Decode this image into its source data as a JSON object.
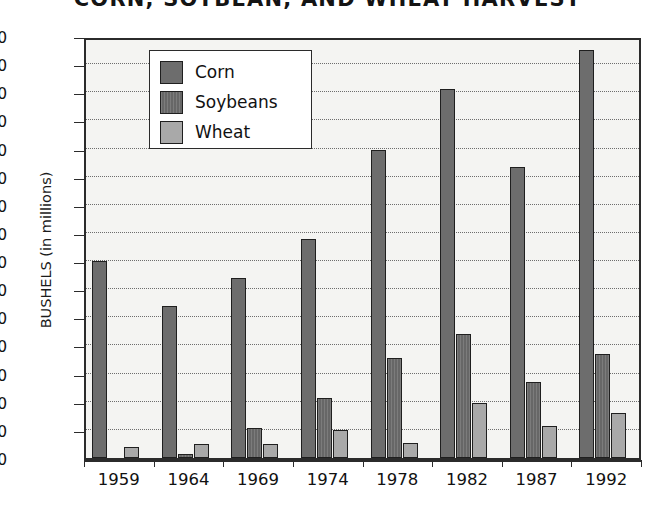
{
  "chart_data": {
    "type": "bar",
    "title": "CORN, SOYBEAN, AND WHEAT HARVEST",
    "xlabel": "",
    "ylabel": "BUSHELS (in millions)",
    "ylim": [
      0,
      150
    ],
    "ytick_step": 10,
    "yticks": [
      0,
      10,
      20,
      30,
      40,
      50,
      60,
      70,
      80,
      90,
      100,
      110,
      120,
      130,
      140,
      150
    ],
    "grid": "horizontal-dotted",
    "legend_position": "top-left-inside",
    "categories": [
      "1959",
      "1964",
      "1969",
      "1974",
      "1978",
      "1982",
      "1987",
      "1992"
    ],
    "series": [
      {
        "name": "Corn",
        "color": "#6d6d6d",
        "values": [
          70,
          54,
          64,
          78,
          109.5,
          131,
          103.5,
          145
        ]
      },
      {
        "name": "Soybeans",
        "color": "#6d6d6d",
        "values": [
          0,
          1.5,
          10.5,
          21.5,
          35.5,
          44,
          27,
          37
        ]
      },
      {
        "name": "Wheat",
        "color": "#a9a9a9",
        "values": [
          4,
          5,
          5,
          10,
          5.5,
          19.5,
          11.5,
          16
        ]
      }
    ]
  },
  "legend": {
    "items": [
      {
        "label": "Corn"
      },
      {
        "label": "Soybeans"
      },
      {
        "label": "Wheat"
      }
    ]
  }
}
